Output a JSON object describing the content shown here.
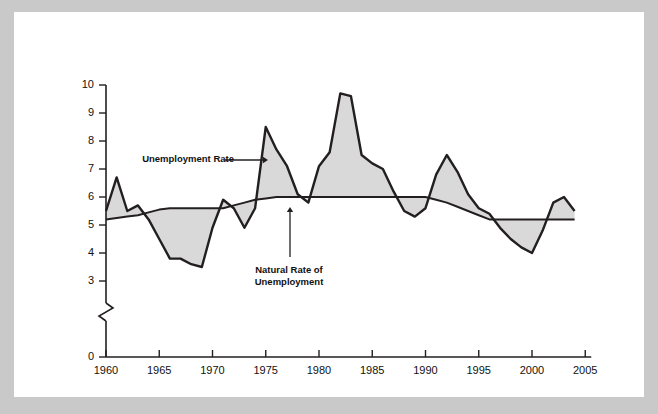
{
  "figure": {
    "background_color": "#c9c9c9",
    "panel_color": "#ffffff",
    "line_color": "#231f20",
    "fill_color": "#d9d9d9"
  },
  "axes": {
    "y_title_line1": "Unemployment",
    "y_title_line2": "Rate (%)",
    "y_ticks": [
      "10",
      "9",
      "8",
      "7",
      "6",
      "5",
      "4",
      "3",
      "0"
    ],
    "x_ticks": [
      "1960",
      "1965",
      "1970",
      "1975",
      "1980",
      "1985",
      "1990",
      "1995",
      "2000",
      "2005"
    ],
    "axis_break": true
  },
  "annotations": [
    {
      "name": "unemployment-rate-label",
      "text": "Unemployment Rate"
    },
    {
      "name": "natural-rate-label-line1",
      "text": "Natural Rate of"
    },
    {
      "name": "natural-rate-label-line2",
      "text": "Unemployment"
    }
  ],
  "chart_data": {
    "type": "line",
    "title": "",
    "subtitle": "",
    "xlabel": "",
    "ylabel": "Unemployment Rate (%)",
    "xlim": [
      1960,
      2005
    ],
    "ylim": [
      3,
      10
    ],
    "y_axis_break_below": 3,
    "grid": false,
    "legend": "inline-annotations",
    "x": [
      1960,
      1961,
      1962,
      1963,
      1964,
      1965,
      1966,
      1967,
      1968,
      1969,
      1970,
      1971,
      1972,
      1973,
      1974,
      1975,
      1976,
      1977,
      1978,
      1979,
      1980,
      1981,
      1982,
      1983,
      1984,
      1985,
      1986,
      1987,
      1988,
      1989,
      1990,
      1991,
      1992,
      1993,
      1994,
      1995,
      1996,
      1997,
      1998,
      1999,
      2000,
      2001,
      2002,
      2003,
      2004
    ],
    "series": [
      {
        "name": "Unemployment Rate",
        "values": [
          5.5,
          6.7,
          5.5,
          5.7,
          5.2,
          4.5,
          3.8,
          3.8,
          3.6,
          3.5,
          4.9,
          5.9,
          5.6,
          4.9,
          5.6,
          8.5,
          7.7,
          7.1,
          6.1,
          5.8,
          7.1,
          7.6,
          9.7,
          9.6,
          7.5,
          7.2,
          7.0,
          6.2,
          5.5,
          5.3,
          5.6,
          6.8,
          7.5,
          6.9,
          6.1,
          5.6,
          5.4,
          4.9,
          4.5,
          4.2,
          4.0,
          4.8,
          5.8,
          6.0,
          5.5
        ]
      },
      {
        "name": "Natural Rate of Unemployment",
        "values": [
          5.2,
          5.25,
          5.3,
          5.35,
          5.45,
          5.55,
          5.6,
          5.6,
          5.6,
          5.6,
          5.6,
          5.6,
          5.7,
          5.8,
          5.9,
          5.95,
          6.0,
          6.0,
          6.0,
          6.0,
          6.0,
          6.0,
          6.0,
          6.0,
          6.0,
          6.0,
          6.0,
          6.0,
          6.0,
          6.0,
          6.0,
          5.9,
          5.8,
          5.65,
          5.5,
          5.35,
          5.2,
          5.2,
          5.2,
          5.2,
          5.2,
          5.2,
          5.2,
          5.2,
          5.2
        ]
      }
    ]
  }
}
